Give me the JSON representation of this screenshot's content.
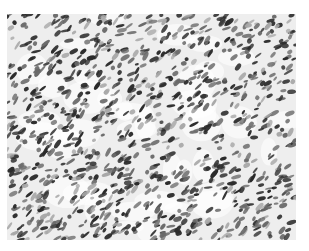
{
  "image": {
    "description": "Grayscale histology micrograph showing densely packed spindle-shaped cell nuclei in a fascicular pattern",
    "background_color": "#eeeeee",
    "nuclei_color_dark": "#2a2a2a",
    "nuclei_color_mid": "#6a6a6a",
    "nuclei_color_light": "#a8a8a8"
  }
}
